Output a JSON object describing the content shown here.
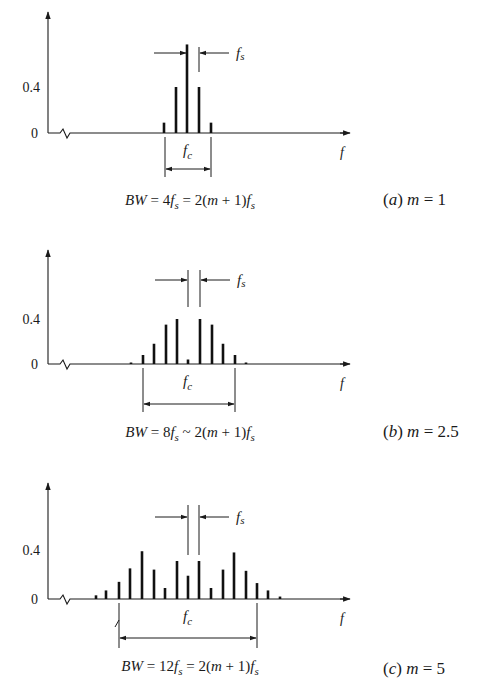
{
  "figure": {
    "colors": {
      "ink": "#1a1a1a",
      "background": "#ffffff"
    },
    "panels": [
      {
        "id": "a",
        "caption_label": "(a)",
        "caption_param": "m = 1",
        "bw_formula": "BW = 4f_s = 2(m + 1)f_s",
        "bw_parts": {
          "lhs": "BW = ",
          "coef": "4",
          "mid": " = 2(",
          "m": "m",
          "rest": " + 1)"
        },
        "y_tick_labels": [
          "0",
          "0.4"
        ],
        "x_axis_label": "f",
        "carrier_label": "f",
        "carrier_sub": "c",
        "spacing_label": "f",
        "spacing_sub": "s",
        "layout": {
          "top": 12,
          "baseline": 133,
          "px_per_04": 46,
          "fs_lines_x": [
            187,
            199
          ],
          "fs_top": 47,
          "fs_bottom": 72,
          "fs_arrow_y": 53,
          "bw_x": [
            165,
            211
          ],
          "bw_arrow_y": 169,
          "bw_bottom": 177,
          "bw_text_y": 205,
          "caption_y": 205,
          "fc_y": 155,
          "sep": "="
        },
        "lines": [
          {
            "x": 164,
            "amplitude": 0.09
          },
          {
            "x": 176,
            "amplitude": 0.4
          },
          {
            "x": 187,
            "amplitude": 0.77
          },
          {
            "x": 199,
            "amplitude": 0.4
          },
          {
            "x": 211,
            "amplitude": 0.09
          }
        ]
      },
      {
        "id": "b",
        "caption_label": "(b)",
        "caption_param": "m = 2.5",
        "bw_formula": "BW = 8f_s ~ 2(m + 1)f_s",
        "bw_parts": {
          "lhs": "BW = ",
          "coef": "8",
          "mid": " ~ 2(",
          "m": "m",
          "rest": " + 1)"
        },
        "y_tick_labels": [
          "0",
          "0.4"
        ],
        "x_axis_label": "f",
        "carrier_label": "f",
        "carrier_sub": "c",
        "spacing_label": "f",
        "spacing_sub": "s",
        "layout": {
          "top": 250,
          "baseline": 364,
          "px_per_04": 45,
          "fs_lines_x": [
            188,
            200
          ],
          "fs_top": 270,
          "fs_bottom": 307,
          "fs_arrow_y": 280,
          "bw_x": [
            143,
            235
          ],
          "bw_arrow_y": 404,
          "bw_bottom": 412,
          "bw_text_y": 437,
          "caption_y": 437,
          "fc_y": 386,
          "sep": "~"
        },
        "lines": [
          {
            "x": 131,
            "amplitude": 0.01
          },
          {
            "x": 143,
            "amplitude": 0.08
          },
          {
            "x": 154,
            "amplitude": 0.18
          },
          {
            "x": 166,
            "amplitude": 0.35
          },
          {
            "x": 177,
            "amplitude": 0.4
          },
          {
            "x": 188,
            "amplitude": 0.04
          },
          {
            "x": 200,
            "amplitude": 0.4
          },
          {
            "x": 212,
            "amplitude": 0.35
          },
          {
            "x": 223,
            "amplitude": 0.18
          },
          {
            "x": 235,
            "amplitude": 0.08
          },
          {
            "x": 246,
            "amplitude": 0.01
          }
        ]
      },
      {
        "id": "c",
        "caption_label": "(c)",
        "caption_param": "m = 5",
        "bw_formula": "BW = 12f_s = 2(m + 1)f_s",
        "bw_parts": {
          "lhs": "BW = ",
          "coef": "12",
          "mid": " = 2(",
          "m": "m",
          "rest": " + 1)"
        },
        "y_tick_labels": [
          "0",
          "0.4"
        ],
        "x_axis_label": "f",
        "carrier_label": "f",
        "carrier_sub": "c",
        "spacing_label": "f",
        "spacing_sub": "s",
        "layout": {
          "top": 483,
          "baseline": 599,
          "px_per_04": 49,
          "fs_lines_x": [
            188,
            199
          ],
          "fs_top": 505,
          "fs_bottom": 555,
          "fs_arrow_y": 517,
          "bw_x": [
            119,
            257
          ],
          "bw_arrow_y": 638,
          "bw_bottom": 648,
          "bw_text_y": 671,
          "caption_y": 674,
          "fc_y": 621,
          "sep": "="
        },
        "lines": [
          {
            "x": 96,
            "amplitude": 0.03
          },
          {
            "x": 106,
            "amplitude": 0.07
          },
          {
            "x": 119,
            "amplitude": 0.14
          },
          {
            "x": 130,
            "amplitude": 0.25
          },
          {
            "x": 142,
            "amplitude": 0.39
          },
          {
            "x": 154,
            "amplitude": 0.24
          },
          {
            "x": 165,
            "amplitude": 0.09
          },
          {
            "x": 177,
            "amplitude": 0.31
          },
          {
            "x": 188,
            "amplitude": 0.19
          },
          {
            "x": 199,
            "amplitude": 0.31
          },
          {
            "x": 211,
            "amplitude": 0.09
          },
          {
            "x": 223,
            "amplitude": 0.24
          },
          {
            "x": 234,
            "amplitude": 0.38
          },
          {
            "x": 246,
            "amplitude": 0.23
          },
          {
            "x": 257,
            "amplitude": 0.13
          },
          {
            "x": 268,
            "amplitude": 0.07
          },
          {
            "x": 280,
            "amplitude": 0.02
          }
        ]
      }
    ]
  }
}
